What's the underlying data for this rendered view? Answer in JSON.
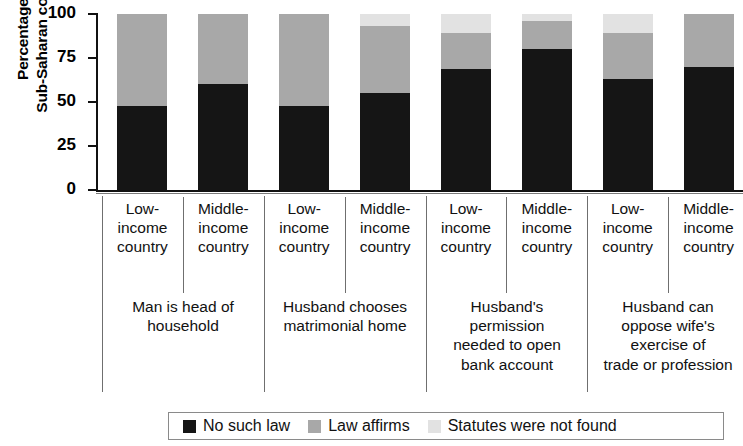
{
  "chart_data": {
    "type": "bar",
    "subtype": "stacked-bar-100",
    "title": "",
    "xlabel": "",
    "ylabel": "Percentage of\nSub-Saharan countries",
    "ylim": [
      0,
      100
    ],
    "ytick_labels": [
      "100",
      "75",
      "50",
      "25",
      "0"
    ],
    "yticks": [
      100,
      75,
      50,
      25,
      0
    ],
    "grid": false,
    "legend_position": "bottom",
    "categories": [
      "Low-income country",
      "Middle-income country",
      "Low-income country",
      "Middle-income country",
      "Low-income country",
      "Middle-income country",
      "Low-income country",
      "Middle-income country"
    ],
    "groups": [
      {
        "label": "Man is head of\nhousehold",
        "categories": [
          "Low-\nincome\ncountry",
          "Middle-\nincome\ncountry"
        ]
      },
      {
        "label": "Husband chooses\nmatrimonial home",
        "categories": [
          "Low-\nincome\ncountry",
          "Middle-\nincome\ncountry"
        ]
      },
      {
        "label": "Husband's\npermission\nneeded to open\nbank account",
        "categories": [
          "Low-\nincome\ncountry",
          "Middle-\nincome\ncountry"
        ]
      },
      {
        "label": "Husband can\noppose wife's\nexercise of\ntrade or profession",
        "categories": [
          "Low-\nincome\ncountry",
          "Middle-\nincome\ncountry"
        ]
      }
    ],
    "series": [
      {
        "name": "No such law",
        "color": "#151515",
        "values": [
          48,
          60,
          48,
          55,
          69,
          80,
          63,
          70
        ]
      },
      {
        "name": "Law affirms",
        "color": "#a8a8a8",
        "values": [
          52,
          40,
          52,
          38,
          20,
          16,
          26,
          30
        ]
      },
      {
        "name": "Statutes were not found",
        "color": "#e2e2e2",
        "values": [
          0,
          0,
          0,
          7,
          11,
          4,
          11,
          0
        ]
      }
    ],
    "bars": [
      {
        "group": "Man is head of household",
        "category": "Low-income country",
        "no_such_law": 48,
        "law_affirms": 52,
        "statutes_not_found": 0
      },
      {
        "group": "Man is head of household",
        "category": "Middle-income country",
        "no_such_law": 60,
        "law_affirms": 40,
        "statutes_not_found": 0
      },
      {
        "group": "Husband chooses matrimonial home",
        "category": "Low-income country",
        "no_such_law": 48,
        "law_affirms": 52,
        "statutes_not_found": 0
      },
      {
        "group": "Husband chooses matrimonial home",
        "category": "Middle-income country",
        "no_such_law": 55,
        "law_affirms": 38,
        "statutes_not_found": 7
      },
      {
        "group": "Husband's permission needed to open bank account",
        "category": "Low-income country",
        "no_such_law": 69,
        "law_affirms": 20,
        "statutes_not_found": 11
      },
      {
        "group": "Husband's permission needed to open bank account",
        "category": "Middle-income country",
        "no_such_law": 80,
        "law_affirms": 16,
        "statutes_not_found": 4
      },
      {
        "group": "Husband can oppose wife's exercise of trade or profession",
        "category": "Low-income country",
        "no_such_law": 63,
        "law_affirms": 26,
        "statutes_not_found": 11
      },
      {
        "group": "Husband can oppose wife's exercise of trade or profession",
        "category": "Middle-income country",
        "no_such_law": 70,
        "law_affirms": 30,
        "statutes_not_found": 0
      }
    ],
    "legend": [
      {
        "label": "No such law",
        "color": "#151515"
      },
      {
        "label": "Law affirms",
        "color": "#a8a8a8"
      },
      {
        "label": "Statutes were not found",
        "color": "#e2e2e2"
      }
    ]
  }
}
